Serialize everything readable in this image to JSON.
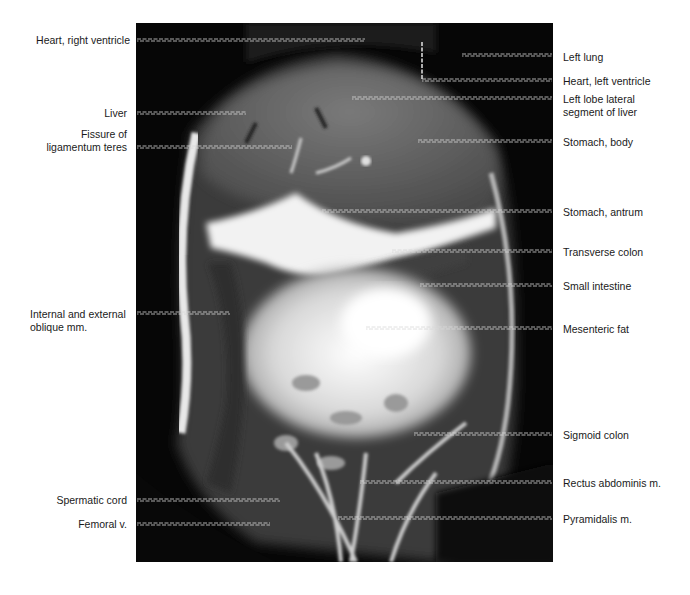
{
  "figure": {
    "type": "coronal MRI, abdomen/pelvis",
    "colors": {
      "background": "#ffffff",
      "scan_background": "#050505",
      "leader": "#d8d8d8",
      "label_text": "#1a1a1a"
    }
  },
  "labels_left": [
    {
      "id": "heart-right-ventricle",
      "text": "Heart, right ventricle",
      "y": 40,
      "line_end_x": 365
    },
    {
      "id": "liver",
      "text": "Liver",
      "y": 113,
      "line_end_x": 246
    },
    {
      "id": "fissure-ligamentum-teres",
      "text": "Fissure of\nligamentum teres",
      "y": 147,
      "line_end_x": 292
    },
    {
      "id": "oblique-mm",
      "text": "Internal and external\noblique mm.",
      "y": 313,
      "line_end_x": 230
    },
    {
      "id": "spermatic-cord",
      "text": "Spermatic cord",
      "y": 500,
      "line_end_x": 280
    },
    {
      "id": "femoral-v",
      "text": "Femoral v.",
      "y": 524,
      "line_end_x": 270
    }
  ],
  "labels_right": [
    {
      "id": "left-lung",
      "text": "Left lung",
      "y": 55,
      "line_start_x": 462
    },
    {
      "id": "heart-left-ventricle",
      "text": "Heart, left ventricle",
      "y": 80,
      "line_start_x": 422,
      "elbow_top_y": 42
    },
    {
      "id": "left-lobe-lateral-segment",
      "text": "Left lobe lateral\nsegment of liver",
      "y": 98,
      "line_start_x": 352
    },
    {
      "id": "stomach-body",
      "text": "Stomach, body",
      "y": 141,
      "line_start_x": 418
    },
    {
      "id": "stomach-antrum",
      "text": "Stomach, antrum",
      "y": 211,
      "line_start_x": 322
    },
    {
      "id": "transverse-colon",
      "text": "Transverse colon",
      "y": 251,
      "line_start_x": 392
    },
    {
      "id": "small-intestine",
      "text": "Small intestine",
      "y": 285,
      "line_start_x": 420
    },
    {
      "id": "mesenteric-fat",
      "text": "Mesenteric fat",
      "y": 328,
      "line_start_x": 366
    },
    {
      "id": "sigmoid-colon",
      "text": "Sigmoid colon",
      "y": 434,
      "line_start_x": 414
    },
    {
      "id": "rectus-abdominis",
      "text": "Rectus abdominis m.",
      "y": 482,
      "line_start_x": 360
    },
    {
      "id": "pyramidalis",
      "text": "Pyramidalis m.",
      "y": 518,
      "line_start_x": 338
    }
  ]
}
